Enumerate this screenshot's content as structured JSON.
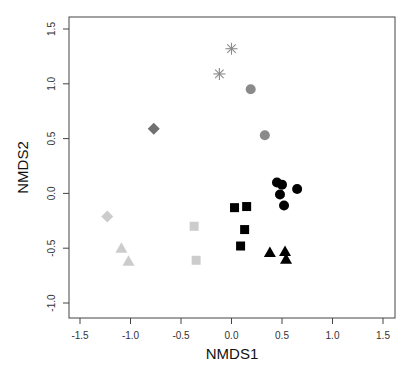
{
  "chart_data": {
    "type": "scatter",
    "title": "",
    "xlabel": "NMDS1",
    "ylabel": "NMDS2",
    "xlim": [
      -1.6,
      1.6
    ],
    "ylim": [
      -1.1,
      1.6
    ],
    "xticks": [
      -1.5,
      -1.0,
      -0.5,
      0.0,
      0.5,
      1.0,
      1.5
    ],
    "xtick_labels": [
      "-1.5",
      "-1.0",
      "-0.5",
      "0.0",
      "0.5",
      "1.0",
      "1.5"
    ],
    "yticks": [
      -1.0,
      -0.5,
      0.0,
      0.5,
      1.0,
      1.5
    ],
    "ytick_labels": [
      "-1.0",
      "-0.5",
      "0.0",
      "0.5",
      "1.0",
      "1.5"
    ],
    "grid": false,
    "legend": null,
    "series": [
      {
        "name": "gray-asterisk",
        "marker": "asterisk",
        "color": "#8a8a8a",
        "points": [
          [
            0.0,
            1.32
          ],
          [
            -0.12,
            1.09
          ]
        ]
      },
      {
        "name": "gray-circle",
        "marker": "circle",
        "color": "#8a8a8a",
        "points": [
          [
            0.19,
            0.95
          ],
          [
            0.33,
            0.53
          ]
        ]
      },
      {
        "name": "dark-gray-diamond",
        "marker": "diamond",
        "color": "#707070",
        "points": [
          [
            -0.77,
            0.59
          ]
        ]
      },
      {
        "name": "light-gray-diamond",
        "marker": "diamond",
        "color": "#cccccc",
        "points": [
          [
            -1.23,
            -0.21
          ]
        ]
      },
      {
        "name": "light-gray-square",
        "marker": "square",
        "color": "#cccccc",
        "points": [
          [
            -0.37,
            -0.3
          ],
          [
            -0.35,
            -0.61
          ]
        ]
      },
      {
        "name": "light-gray-triangle",
        "marker": "triangle",
        "color": "#cccccc",
        "points": [
          [
            -1.09,
            -0.5
          ],
          [
            -1.02,
            -0.62
          ]
        ]
      },
      {
        "name": "black-square",
        "marker": "square",
        "color": "#000000",
        "points": [
          [
            0.03,
            -0.13
          ],
          [
            0.15,
            -0.12
          ],
          [
            0.13,
            -0.33
          ],
          [
            0.09,
            -0.48
          ]
        ]
      },
      {
        "name": "black-circle",
        "marker": "circle",
        "color": "#000000",
        "points": [
          [
            0.45,
            0.1
          ],
          [
            0.5,
            0.08
          ],
          [
            0.48,
            -0.01
          ],
          [
            0.65,
            0.04
          ],
          [
            0.52,
            -0.11
          ]
        ]
      },
      {
        "name": "black-triangle",
        "marker": "triangle",
        "color": "#000000",
        "points": [
          [
            0.38,
            -0.54
          ],
          [
            0.53,
            -0.53
          ],
          [
            0.54,
            -0.6
          ]
        ]
      }
    ]
  },
  "layout": {
    "plot_box": {
      "left": 69,
      "top": 17,
      "right": 395,
      "bottom": 318
    },
    "x_px_per_unit": 101,
    "x_origin_px": 231.5,
    "y_px_per_unit": 109.6,
    "y_origin_px": 193.4
  }
}
